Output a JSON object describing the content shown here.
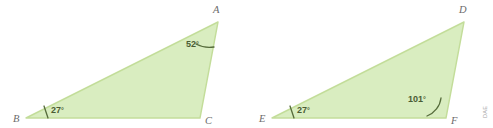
{
  "figure": {
    "type": "geometry-diagram",
    "background_color": "#ffffff",
    "fill_color": "#d9edc0",
    "stroke_color": "#c3dd9a",
    "arc_color": "#556b3a",
    "label_color": "#6b6b6b",
    "angle_label_color": "#4b5c34",
    "degree_symbol": "°"
  },
  "triangles": [
    {
      "name": "triangle-abc",
      "vertices": [
        {
          "label": "A",
          "x": 218,
          "y": 22,
          "label_x": 213,
          "label_y": 13
        },
        {
          "label": "B",
          "x": 26,
          "y": 118,
          "label_x": 13,
          "label_y": 122
        },
        {
          "label": "C",
          "x": 200,
          "y": 118,
          "label_x": 205,
          "label_y": 124
        }
      ],
      "angles": [
        {
          "at": "A",
          "value": "52",
          "unit": "°",
          "label_x": 186,
          "label_y": 47
        },
        {
          "at": "B",
          "value": "27",
          "unit": "°",
          "label_x": 51,
          "label_y": 113
        }
      ]
    },
    {
      "name": "triangle-def",
      "vertices": [
        {
          "label": "D",
          "x": 464,
          "y": 22,
          "label_x": 459,
          "label_y": 13
        },
        {
          "label": "E",
          "x": 272,
          "y": 118,
          "label_x": 259,
          "label_y": 122
        },
        {
          "label": "F",
          "x": 446,
          "y": 118,
          "label_x": 451,
          "label_y": 124
        }
      ],
      "angles": [
        {
          "at": "F",
          "value": "101",
          "unit": "°",
          "label_x": 408,
          "label_y": 102
        },
        {
          "at": "E",
          "value": "27",
          "unit": "°",
          "label_x": 297,
          "label_y": 113
        }
      ]
    }
  ],
  "watermark": {
    "text": "DAE"
  }
}
